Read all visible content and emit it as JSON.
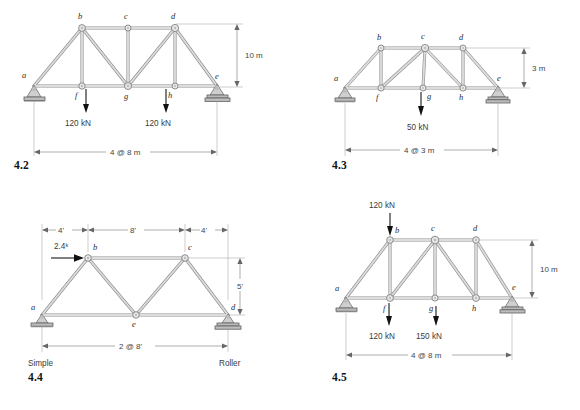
{
  "figures": [
    {
      "id": "4.2",
      "number": "4.2",
      "height_dim": "10 m",
      "span_dim": "4 @ 8 m",
      "node_labels": [
        "a",
        "b",
        "c",
        "d",
        "e",
        "f",
        "g",
        "h"
      ],
      "loads": [
        {
          "label": "120 kN",
          "node": "f"
        },
        {
          "label": "120 kN",
          "node": "h"
        }
      ],
      "supports": [
        "pin",
        "roller"
      ],
      "support_labels": []
    },
    {
      "id": "4.3",
      "number": "4.3",
      "height_dim": "3 m",
      "span_dim": "4 @ 3 m",
      "node_labels": [
        "a",
        "b",
        "c",
        "d",
        "e",
        "f",
        "g",
        "h"
      ],
      "loads": [
        {
          "label": "50 kN",
          "node": "g"
        }
      ],
      "supports": [
        "pin",
        "roller"
      ],
      "support_labels": []
    },
    {
      "id": "4.4",
      "number": "4.4",
      "height_dim": "5'",
      "span_dim": "2 @ 8'",
      "panel_dims": [
        "4'",
        "8'",
        "4'"
      ],
      "node_labels": [
        "a",
        "b",
        "c",
        "d",
        "e"
      ],
      "loads": [
        {
          "label": "2.4ᵏ",
          "node": "b"
        }
      ],
      "supports": [
        "simple",
        "roller"
      ],
      "support_labels": [
        "Simple",
        "Roller"
      ]
    },
    {
      "id": "4.5",
      "number": "4.5",
      "height_dim": "10 m",
      "span_dim": "4 @ 8 m",
      "node_labels": [
        "a",
        "b",
        "c",
        "d",
        "e",
        "f",
        "g",
        "h"
      ],
      "loads": [
        {
          "label": "120 kN",
          "node": "b"
        },
        {
          "label": "120 kN",
          "node": "f"
        },
        {
          "label": "150 kN",
          "node": "g"
        }
      ],
      "supports": [
        "pin",
        "roller"
      ],
      "support_labels": []
    }
  ],
  "colors": {
    "member_outline": "#8e8e8e",
    "member_fill": "#dcdcdc",
    "dimension": "#777777",
    "text": "#333333",
    "background": "#ffffff"
  }
}
